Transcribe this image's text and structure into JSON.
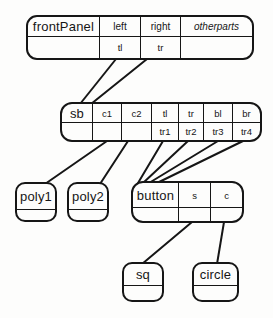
{
  "diagram": {
    "background": "#fdfdfc",
    "line_color": "#161616"
  },
  "nodes": {
    "front_panel": {
      "title": "frontPanel",
      "slots": [
        "left",
        "right",
        "otherparts"
      ],
      "values": [
        "tl",
        "tr",
        ""
      ]
    },
    "sb": {
      "title": "sb",
      "slots": [
        "c1",
        "c2",
        "tl",
        "tr",
        "bl",
        "br"
      ],
      "values": [
        "",
        "",
        "tr1",
        "tr2",
        "tr3",
        "tr4"
      ]
    },
    "poly1": {
      "title": "poly1"
    },
    "poly2": {
      "title": "poly2"
    },
    "button": {
      "title": "button",
      "slots": [
        "s",
        "c"
      ],
      "values": [
        "",
        ""
      ]
    },
    "sq": {
      "title": "sq"
    },
    "circle": {
      "title": "circle"
    }
  },
  "edges": [
    {
      "from": "frontPanel.tl",
      "to": "sb"
    },
    {
      "from": "frontPanel.tr",
      "to": "sb"
    },
    {
      "from": "sb.c1",
      "to": "poly1"
    },
    {
      "from": "sb.c2",
      "to": "poly2"
    },
    {
      "from": "sb.tr1",
      "to": "button"
    },
    {
      "from": "sb.tr2",
      "to": "button"
    },
    {
      "from": "sb.tr3",
      "to": "button"
    },
    {
      "from": "sb.tr4",
      "to": "button"
    },
    {
      "from": "button.s",
      "to": "sq"
    },
    {
      "from": "button.c",
      "to": "circle"
    }
  ]
}
